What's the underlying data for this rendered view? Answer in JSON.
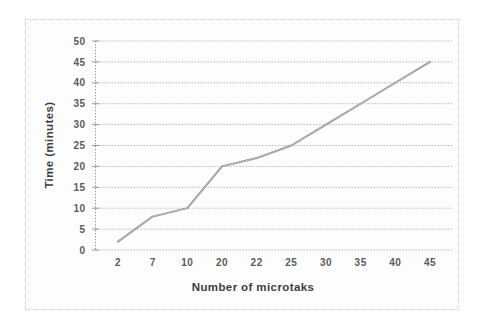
{
  "chart_data": {
    "type": "line",
    "title": "",
    "xlabel": "Number of microtaks",
    "ylabel": "Time (minutes)",
    "categories": [
      "2",
      "7",
      "10",
      "20",
      "22",
      "25",
      "30",
      "35",
      "40",
      "45"
    ],
    "values": [
      2,
      8,
      10,
      20,
      22,
      25,
      30,
      35,
      40,
      45
    ],
    "series": [
      {
        "name": "Time",
        "values": [
          2,
          8,
          10,
          20,
          22,
          25,
          30,
          35,
          40,
          45
        ]
      }
    ],
    "ylim": [
      0,
      50
    ],
    "yticks": [
      "0",
      "5",
      "10",
      "15",
      "20",
      "25",
      "30",
      "35",
      "40",
      "45",
      "50"
    ],
    "ytick_values": [
      0,
      5,
      10,
      15,
      20,
      25,
      30,
      35,
      40,
      45,
      50
    ],
    "grid": "horizontal-dotted",
    "legend": "none",
    "line_color": "#8c8c8c",
    "grid_color": "#b4b4b4",
    "axis_color": "#9a9a9a",
    "background": "#ffffff"
  }
}
